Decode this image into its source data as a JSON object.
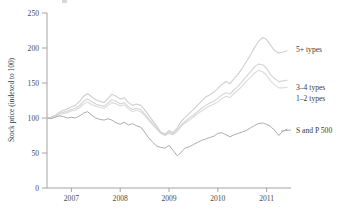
{
  "chart_data": {
    "type": "line",
    "title": "",
    "xlabel": "",
    "ylabel": "Stock price (indexed to 100)",
    "ylim": [
      0,
      250
    ],
    "yticks": [
      0,
      50,
      100,
      150,
      200,
      250
    ],
    "xlim": [
      2006.5,
      2011.5
    ],
    "xticks": [
      2007,
      2008,
      2009,
      2010,
      2011
    ],
    "xticklabels": [
      "2007",
      "2008",
      "2009",
      "2010",
      "2011"
    ],
    "grid": false,
    "legend_position": "right-inline",
    "x": [
      2006.5,
      2006.58,
      2006.67,
      2006.75,
      2006.83,
      2006.92,
      2007.0,
      2007.08,
      2007.17,
      2007.25,
      2007.33,
      2007.42,
      2007.5,
      2007.58,
      2007.67,
      2007.75,
      2007.83,
      2007.92,
      2008.0,
      2008.08,
      2008.17,
      2008.25,
      2008.33,
      2008.42,
      2008.5,
      2008.58,
      2008.67,
      2008.75,
      2008.83,
      2008.92,
      2009.0,
      2009.08,
      2009.17,
      2009.25,
      2009.33,
      2009.42,
      2009.5,
      2009.58,
      2009.67,
      2009.75,
      2009.83,
      2009.92,
      2010.0,
      2010.08,
      2010.17,
      2010.25,
      2010.33,
      2010.42,
      2010.5,
      2010.58,
      2010.67,
      2010.75,
      2010.83,
      2010.92,
      2011.0,
      2011.08,
      2011.17,
      2011.25,
      2011.33,
      2011.42
    ],
    "series": [
      {
        "name": "5+ types",
        "color": "#d0d0d0",
        "label_value": 195,
        "values": [
          100,
          101,
          104,
          108,
          111,
          113,
          116,
          118,
          124,
          131,
          135,
          130,
          126,
          124,
          122,
          128,
          134,
          131,
          127,
          129,
          122,
          118,
          120,
          118,
          112,
          104,
          96,
          88,
          80,
          77,
          82,
          79,
          86,
          95,
          101,
          107,
          112,
          118,
          124,
          130,
          133,
          137,
          142,
          148,
          152,
          149,
          156,
          163,
          171,
          180,
          190,
          200,
          209,
          215,
          212,
          204,
          196,
          193,
          194,
          196
        ]
      },
      {
        "name": "3-4 types",
        "color": "#d6d6d6",
        "label_value": 152,
        "values": [
          100,
          101,
          103,
          106,
          108,
          110,
          112,
          114,
          118,
          124,
          127,
          123,
          120,
          118,
          117,
          121,
          126,
          124,
          120,
          122,
          116,
          112,
          114,
          112,
          106,
          99,
          92,
          85,
          79,
          76,
          80,
          77,
          83,
          90,
          95,
          100,
          104,
          109,
          114,
          118,
          121,
          124,
          128,
          133,
          136,
          134,
          140,
          146,
          152,
          159,
          166,
          173,
          177,
          176,
          171,
          162,
          156,
          152,
          153,
          154
        ]
      },
      {
        "name": "1-2 types",
        "color": "#dcdcdc",
        "label_value": 142,
        "values": [
          100,
          100,
          102,
          104,
          106,
          108,
          110,
          111,
          115,
          120,
          123,
          119,
          117,
          115,
          114,
          118,
          122,
          120,
          117,
          119,
          113,
          109,
          111,
          109,
          104,
          97,
          90,
          84,
          78,
          75,
          78,
          76,
          81,
          88,
          93,
          97,
          101,
          106,
          110,
          114,
          117,
          120,
          123,
          128,
          131,
          129,
          135,
          140,
          146,
          152,
          158,
          164,
          168,
          166,
          161,
          153,
          147,
          143,
          143,
          144
        ]
      },
      {
        "name": "S and P 500",
        "color": "#a8a8a8",
        "label_value": 85,
        "values": [
          100,
          99,
          101,
          103,
          102,
          100,
          101,
          100,
          103,
          107,
          109,
          104,
          100,
          98,
          97,
          99,
          97,
          93,
          91,
          94,
          90,
          92,
          89,
          87,
          80,
          72,
          65,
          60,
          58,
          57,
          61,
          54,
          46,
          51,
          57,
          59,
          62,
          65,
          68,
          70,
          72,
          74,
          78,
          79,
          76,
          73,
          76,
          78,
          80,
          82,
          86,
          89,
          92,
          93,
          91,
          88,
          82,
          75,
          81,
          84
        ]
      }
    ],
    "annotations": [
      {
        "text": "5+ types",
        "series": "5+ types"
      },
      {
        "text": "3–4 types",
        "series": "3-4 types"
      },
      {
        "text": "1–2 types",
        "series": "1-2 types"
      },
      {
        "text": "S and P 500",
        "series": "S and P 500"
      }
    ]
  },
  "labels": {
    "ylabel": "Stock price (indexed to 100)",
    "legend_5plus": "5+ types",
    "legend_34": "3–4 types",
    "legend_12": "1–2 types",
    "legend_sp": "S and P 500",
    "ytick_0": "0",
    "ytick_50": "50",
    "ytick_100": "100",
    "ytick_150": "150",
    "ytick_200": "200",
    "ytick_250": "250",
    "xtick_2007": "2007",
    "xtick_2008": "2008",
    "xtick_2009": "2009",
    "xtick_2010": "2010",
    "xtick_2011": "2011"
  }
}
